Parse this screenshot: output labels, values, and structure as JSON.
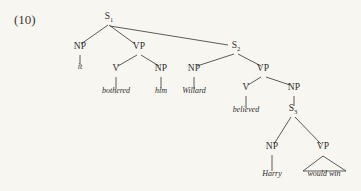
{
  "figure": {
    "example_number": "(10)",
    "background_color": "#f8f6f1",
    "line_color": "#4a4a4a",
    "text_color": "#2f2f2f",
    "type": "syntax-tree",
    "sentence": "it bothered him Willard believed Harry would win"
  },
  "nodes": {
    "s1": {
      "label": "S",
      "subscript": "1",
      "x": 109,
      "y": 20
    },
    "np_it": {
      "label": "NP",
      "x": 80,
      "y": 50
    },
    "vp1": {
      "label": "VP",
      "x": 139,
      "y": 50
    },
    "s2": {
      "label": "S",
      "subscript": "2",
      "x": 236,
      "y": 49
    },
    "v_bothered": {
      "label": "V",
      "x": 116,
      "y": 72
    },
    "np_him": {
      "label": "NP",
      "x": 161,
      "y": 72
    },
    "np_willard": {
      "label": "NP",
      "x": 194,
      "y": 72
    },
    "vp2": {
      "label": "VP",
      "x": 263,
      "y": 72
    },
    "v_believed": {
      "label": "V",
      "x": 246,
      "y": 91
    },
    "np_s3": {
      "label": "NP",
      "x": 294,
      "y": 91
    },
    "s3": {
      "label": "S",
      "subscript": "3",
      "x": 293,
      "y": 112
    },
    "np_harry": {
      "label": "NP",
      "x": 272,
      "y": 150
    },
    "vp3": {
      "label": "VP",
      "x": 323,
      "y": 150
    }
  },
  "terminals": {
    "it": {
      "text": "it",
      "x": 80,
      "y": 71
    },
    "bothered": {
      "text": "bothered",
      "x": 116,
      "y": 95
    },
    "him": {
      "text": "him",
      "x": 161,
      "y": 95
    },
    "willard": {
      "text": "Willard",
      "x": 194,
      "y": 95
    },
    "believed": {
      "text": "believed",
      "x": 246,
      "y": 114
    },
    "harry": {
      "text": "Harry",
      "x": 272,
      "y": 178
    },
    "would_win": {
      "text": "would win",
      "x": 324,
      "y": 178
    }
  },
  "edges": [
    {
      "name": "s1-to-np",
      "x1": 108,
      "y1": 25,
      "x2": 81,
      "y2": 44
    },
    {
      "name": "s1-to-vp1",
      "x1": 109,
      "y1": 25,
      "x2": 135,
      "y2": 44
    },
    {
      "name": "s1-to-s2",
      "x1": 110,
      "y1": 26,
      "x2": 228,
      "y2": 45
    },
    {
      "name": "np-it-stem",
      "x1": 80,
      "y1": 55,
      "x2": 80,
      "y2": 65
    },
    {
      "name": "vp1-to-v",
      "x1": 137,
      "y1": 55,
      "x2": 118,
      "y2": 66
    },
    {
      "name": "vp1-to-np-him",
      "x1": 141,
      "y1": 55,
      "x2": 159,
      "y2": 66
    },
    {
      "name": "v-bothered-stem",
      "x1": 116,
      "y1": 77,
      "x2": 116,
      "y2": 89
    },
    {
      "name": "np-him-stem",
      "x1": 161,
      "y1": 77,
      "x2": 161,
      "y2": 89
    },
    {
      "name": "s2-to-np-willard",
      "x1": 234,
      "y1": 54,
      "x2": 197,
      "y2": 66
    },
    {
      "name": "s2-to-vp2",
      "x1": 238,
      "y1": 54,
      "x2": 261,
      "y2": 66
    },
    {
      "name": "np-willard-stem",
      "x1": 194,
      "y1": 77,
      "x2": 194,
      "y2": 89
    },
    {
      "name": "vp2-to-v-believed",
      "x1": 261,
      "y1": 77,
      "x2": 248,
      "y2": 85
    },
    {
      "name": "vp2-to-np-s3",
      "x1": 266,
      "y1": 77,
      "x2": 290,
      "y2": 85
    },
    {
      "name": "v-believed-stem",
      "x1": 246,
      "y1": 96,
      "x2": 246,
      "y2": 108
    },
    {
      "name": "np-s3-stem",
      "x1": 294,
      "y1": 96,
      "x2": 294,
      "y2": 106
    },
    {
      "name": "s3-to-np-harry",
      "x1": 291,
      "y1": 117,
      "x2": 274,
      "y2": 144
    },
    {
      "name": "s3-to-vp3",
      "x1": 295,
      "y1": 117,
      "x2": 321,
      "y2": 144
    },
    {
      "name": "np-harry-stem",
      "x1": 272,
      "y1": 155,
      "x2": 272,
      "y2": 171
    }
  ],
  "triangle": {
    "name": "vp3-triangle",
    "apex_x": 323,
    "apex_y": 156,
    "left_x": 303,
    "right_x": 346,
    "base_y": 171
  }
}
